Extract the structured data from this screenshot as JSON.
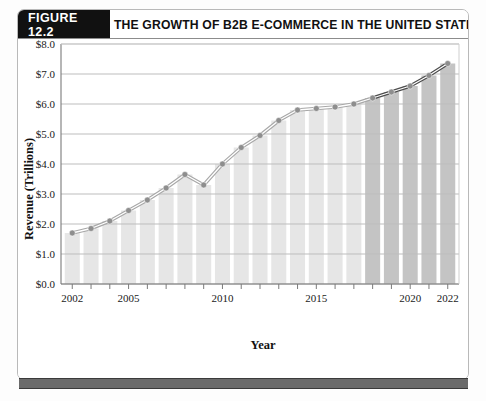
{
  "figure": {
    "tag_label": "FIGURE 12.2",
    "title": "THE GROWTH OF B2B E-COMMERCE IN THE UNITED STATES"
  },
  "colors": {
    "tag_background": "#111111",
    "title_text": "#111111",
    "frame_border": "#b9b9b9",
    "gridline": "#bdbdbd",
    "bar_actual": "#e6e6e6",
    "bar_projected": "#c4c4c4",
    "line_actual": "#a8a8a8",
    "line_projected": "#4d4d4d",
    "marker": "#8e8e8e",
    "bottom_rule": "#6b6b6b"
  },
  "chart_data": {
    "type": "line",
    "title": "THE GROWTH OF B2B E-COMMERCE IN THE UNITED STATES",
    "xlabel": "Year",
    "ylabel": "Revenue (Trillions)",
    "xlim": [
      2001.4,
      2022.6
    ],
    "ylim": [
      0,
      8
    ],
    "grid": true,
    "legend_position": "none",
    "y_ticks": [
      0,
      1,
      2,
      3,
      4,
      5,
      6,
      7,
      8
    ],
    "y_tick_labels": [
      "$0.0",
      "$1.0",
      "$2.0",
      "$3.0",
      "$4.0",
      "$5.0",
      "$6.0",
      "$7.0",
      "$8.0"
    ],
    "x_ticks": [
      2002,
      2003,
      2004,
      2005,
      2006,
      2007,
      2008,
      2009,
      2010,
      2011,
      2012,
      2013,
      2014,
      2015,
      2016,
      2017,
      2018,
      2019,
      2020,
      2021,
      2022
    ],
    "x_tick_labels_shown": [
      "2002",
      "2005",
      "2010",
      "2015",
      "2020",
      "2022"
    ],
    "x_labeled_years": [
      2002,
      2005,
      2010,
      2015,
      2020,
      2022
    ],
    "categories": [
      2002,
      2003,
      2004,
      2005,
      2006,
      2007,
      2008,
      2009,
      2010,
      2011,
      2012,
      2013,
      2014,
      2015,
      2016,
      2017,
      2018,
      2019,
      2020,
      2021,
      2022
    ],
    "values": [
      1.7,
      1.85,
      2.1,
      2.45,
      2.8,
      3.2,
      3.65,
      3.3,
      4.0,
      4.55,
      4.95,
      5.45,
      5.8,
      5.85,
      5.9,
      6.0,
      6.2,
      6.4,
      6.6,
      6.95,
      7.35
    ],
    "series": [
      {
        "name": "B2B E-Commerce Revenue",
        "unit": "Trillions of US dollars",
        "values": [
          1.7,
          1.85,
          2.1,
          2.45,
          2.8,
          3.2,
          3.65,
          3.3,
          4.0,
          4.55,
          4.95,
          5.45,
          5.8,
          5.85,
          5.9,
          6.0,
          6.2,
          6.4,
          6.6,
          6.95,
          7.35
        ]
      }
    ],
    "projection_start_year": 2018,
    "annotations": []
  }
}
